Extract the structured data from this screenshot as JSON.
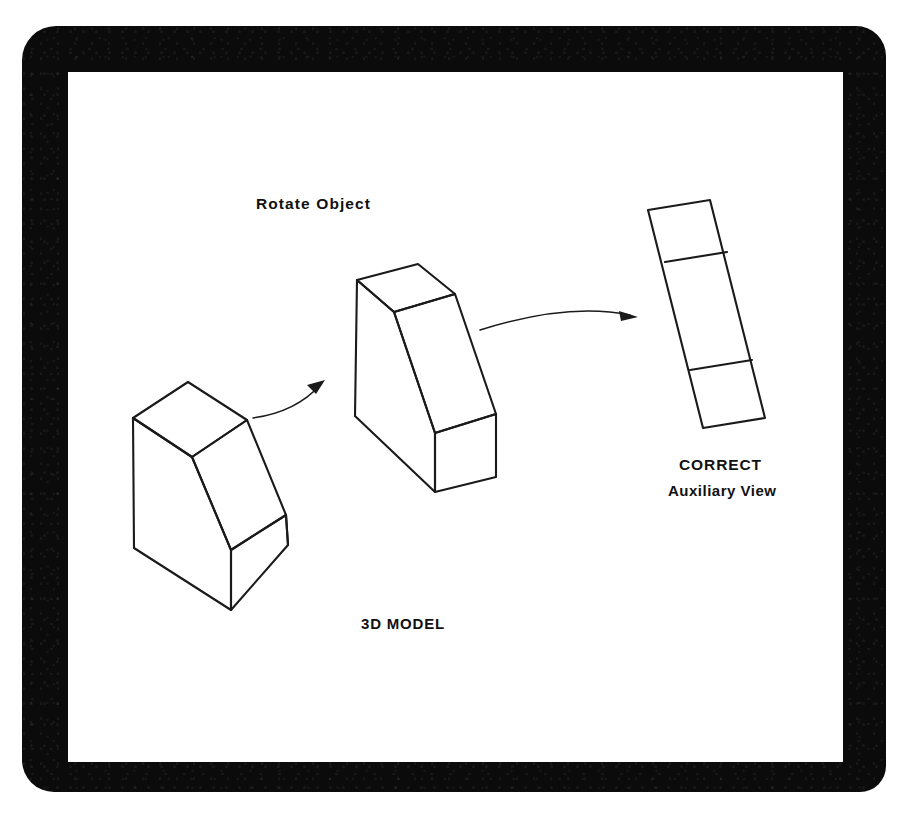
{
  "figure": {
    "frame": {
      "style": "black-rounded-bezel",
      "color": "#0b0b0b",
      "surface_color": "#ffffff"
    },
    "line_color": "#1a1a1a",
    "labels": {
      "rotate_object": "Rotate  Object",
      "model": "3D MODEL",
      "correct": "CORRECT",
      "auxiliary_view": "Auxiliary View"
    },
    "shapes": [
      {
        "name": "isometric-model-original",
        "description": "Rectangular block with inclined top face shown in isometric pictorial view",
        "faces": [
          "top",
          "inclined",
          "front",
          "right-side"
        ]
      },
      {
        "name": "isometric-model-rotated",
        "description": "Same block rotated so the inclined face is viewed more edge-on",
        "faces": [
          "top",
          "inclined",
          "front",
          "right-side"
        ]
      },
      {
        "name": "auxiliary-view-result",
        "description": "True-shape auxiliary view: tilted rectangle divided into three bands",
        "divisions": 3
      }
    ],
    "arrows": [
      {
        "name": "arrow-model-to-rotated",
        "from": "3D MODEL",
        "to": "rotated model"
      },
      {
        "name": "arrow-rotated-to-auxiliary",
        "from": "rotated model",
        "to": "auxiliary view"
      }
    ]
  }
}
